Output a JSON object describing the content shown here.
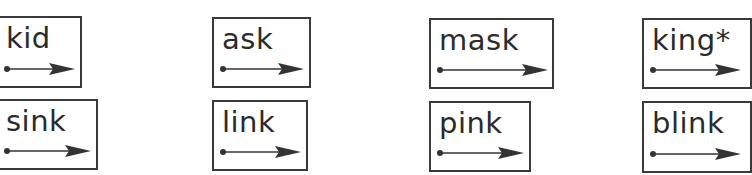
{
  "worksheet": {
    "cards": [
      {
        "word": "kid",
        "left": -4,
        "top": 16,
        "width": 86,
        "height": 72,
        "arrow_len": 70
      },
      {
        "word": "ask",
        "left": 212,
        "top": 17,
        "width": 99,
        "height": 71,
        "arrow_len": 83
      },
      {
        "word": "mask",
        "left": 429,
        "top": 18,
        "width": 125,
        "height": 71,
        "arrow_len": 110
      },
      {
        "word": "king*",
        "left": 642,
        "top": 18,
        "width": 110,
        "height": 71,
        "arrow_len": 90
      },
      {
        "word": "sink",
        "left": -4,
        "top": 99,
        "width": 102,
        "height": 71,
        "arrow_len": 86
      },
      {
        "word": "link",
        "left": 212,
        "top": 100,
        "width": 96,
        "height": 71,
        "arrow_len": 80
      },
      {
        "word": "pink",
        "left": 429,
        "top": 101,
        "width": 102,
        "height": 71,
        "arrow_len": 86
      },
      {
        "word": "blink",
        "left": 642,
        "top": 101,
        "width": 110,
        "height": 72,
        "arrow_len": 90
      }
    ],
    "colors": {
      "ink": "#2b2b2b",
      "border": "#3a3a3a",
      "arrow": "#333333"
    }
  }
}
